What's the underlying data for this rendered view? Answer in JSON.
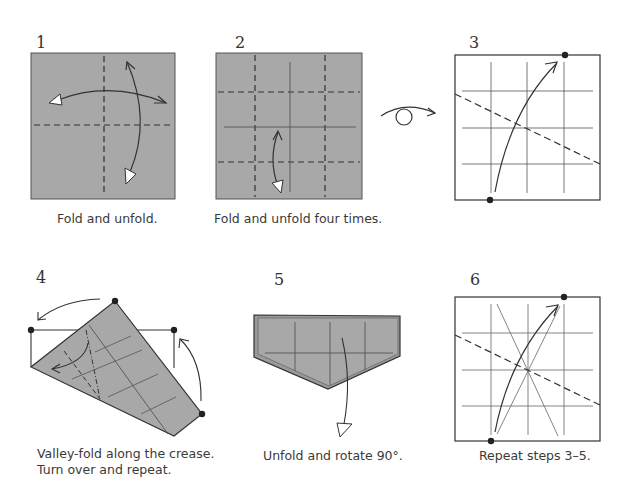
{
  "colors": {
    "paper": "#a8a8a8",
    "line": "#3a3a3a",
    "background": "#ffffff"
  },
  "steps": [
    {
      "number": "1",
      "caption": "Fold and unfold."
    },
    {
      "number": "2",
      "caption": "Fold and unfold four times."
    },
    {
      "number": "3",
      "caption": ""
    },
    {
      "number": "4",
      "caption_line1": "Valley-fold along the crease.",
      "caption_line2": "Turn over and repeat."
    },
    {
      "number": "5",
      "caption": "Unfold and rotate 90°."
    },
    {
      "number": "6",
      "caption": "Repeat steps 3–5."
    }
  ],
  "symbols": {
    "turn_over": "turn-over-icon"
  }
}
